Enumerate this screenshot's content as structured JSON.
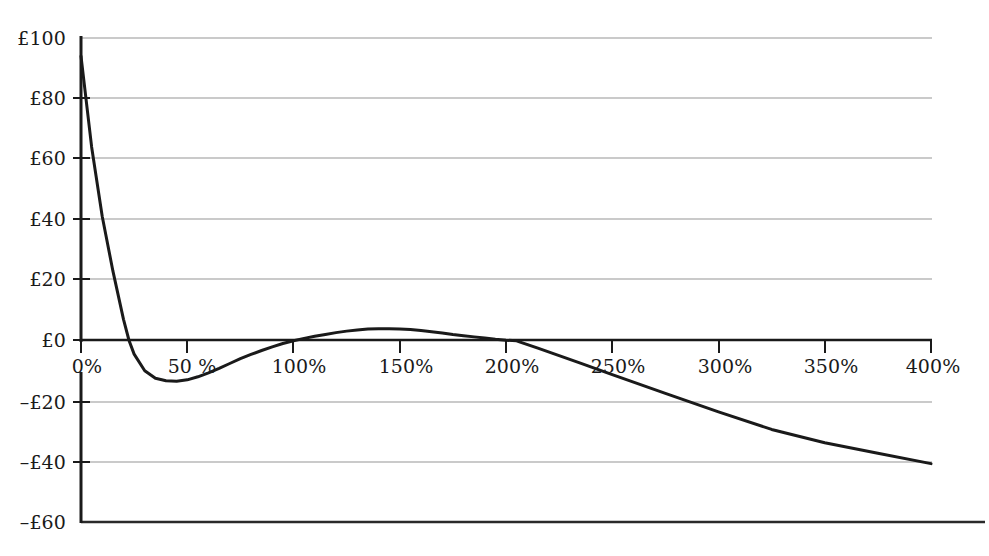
{
  "chart_data": {
    "type": "line",
    "title": "",
    "subtitle": "",
    "xlabel": "",
    "ylabel": "",
    "xlim": [
      0,
      400
    ],
    "ylim": [
      -60,
      100
    ],
    "grid": true,
    "legend": "none",
    "x_unit": "%",
    "y_unit": "£",
    "x_tick_values": [
      0,
      50,
      100,
      150,
      200,
      250,
      300,
      350,
      400
    ],
    "x_tick_labels": [
      "0%",
      "50 %",
      "100%",
      "150%",
      "200%",
      "250%",
      "300%",
      "350%",
      "400%"
    ],
    "y_tick_values": [
      100,
      80,
      60,
      40,
      20,
      0,
      -20,
      -40,
      -60
    ],
    "y_tick_labels": [
      "£100",
      "£80",
      "£60",
      "£40",
      "£20",
      "£0",
      "–£20",
      "–£40",
      "–£60"
    ],
    "series": [
      {
        "name": "NPV",
        "color": "#1a1a1a",
        "line_width": 3,
        "x": [
          0,
          5,
          10,
          15,
          20,
          22.6,
          25,
          30,
          35,
          40,
          45,
          50,
          55,
          60,
          65,
          70,
          75,
          80,
          85,
          90,
          95,
          100,
          105,
          110,
          115,
          120,
          125,
          130,
          135,
          140,
          145,
          150,
          155,
          160,
          165,
          170,
          175,
          180,
          185,
          190,
          195,
          200,
          205,
          207,
          215,
          225,
          235,
          250,
          275,
          300,
          325,
          350,
          375,
          400
        ],
        "y": [
          94,
          64,
          41,
          23,
          7,
          0,
          -4.5,
          -10,
          -12.5,
          -13.3,
          -13.5,
          -13.0,
          -12.0,
          -10.7,
          -9.2,
          -7.6,
          -6.0,
          -4.6,
          -3.3,
          -2.1,
          -1.0,
          -0.1,
          0.7,
          1.4,
          2.0,
          2.6,
          3.1,
          3.5,
          3.8,
          3.9,
          3.9,
          3.8,
          3.6,
          3.3,
          2.9,
          2.5,
          2.0,
          1.6,
          1.2,
          0.8,
          0.4,
          0.1,
          -0.1,
          -0.6,
          -2.5,
          -5.0,
          -7.5,
          -11.3,
          -17.5,
          -23.6,
          -29.4,
          -33.8,
          -37.3,
          -40.7
        ]
      }
    ],
    "annotations": [],
    "axis_color": "#1a1a1a",
    "gridline_color": "#b5b5b5",
    "baseline_color": "#1a1a1a"
  },
  "axes": {
    "y_axis_name": "value-axis",
    "x_axis_name": "percentage-axis"
  }
}
